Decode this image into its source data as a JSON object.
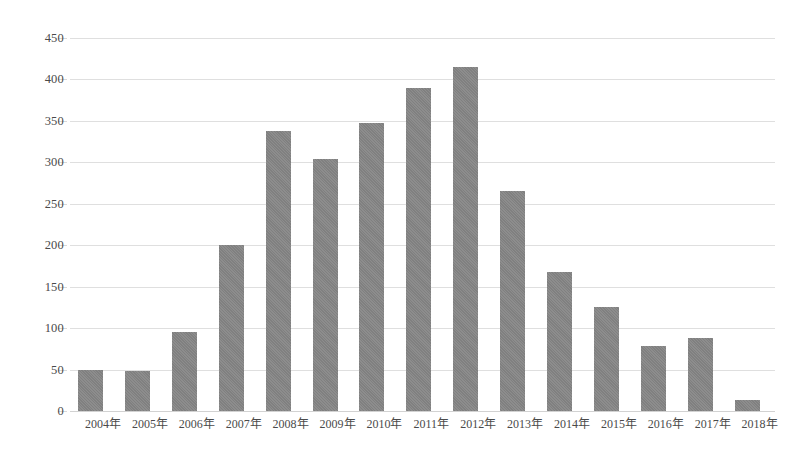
{
  "chart_data": {
    "type": "bar",
    "title": "",
    "subtitle": "",
    "xlabel": "",
    "ylabel": "",
    "categories": [
      "2004年",
      "2005年",
      "2006年",
      "2007年",
      "2008年",
      "2009年",
      "2010年",
      "2011年",
      "2012年",
      "2013年",
      "2014年",
      "2015年",
      "2016年",
      "2017年",
      "2018年"
    ],
    "values": [
      50,
      48,
      95,
      200,
      338,
      304,
      348,
      390,
      415,
      265,
      168,
      126,
      78,
      88,
      13
    ],
    "series": [
      {
        "name": "",
        "values": [
          50,
          48,
          95,
          200,
          338,
          304,
          348,
          390,
          415,
          265,
          168,
          126,
          78,
          88,
          13
        ]
      }
    ],
    "ylim": [
      0,
      450
    ],
    "ytick_values": [
      0,
      50,
      100,
      150,
      200,
      250,
      300,
      350,
      400,
      450
    ],
    "ytick_labels": [
      "0",
      "50",
      "100",
      "150",
      "200",
      "250",
      "300",
      "350",
      "400",
      "450"
    ],
    "grid": true,
    "grid_axis": "y",
    "legend": false,
    "legend_position": "none",
    "bar_color": "#808080",
    "gridline_color": "#dfdfdf",
    "text_color": "#4a4a4a",
    "background_color": "#ffffff",
    "annotations": []
  }
}
